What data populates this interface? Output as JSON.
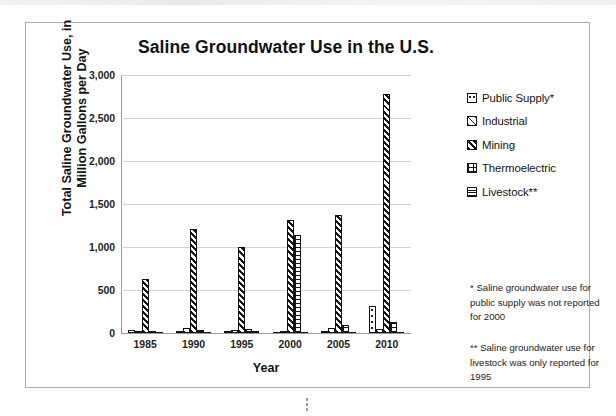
{
  "chart_data": {
    "type": "bar",
    "title": "Saline Groundwater Use in the U.S.",
    "xlabel": "Year",
    "ylabel": "Total Saline Groundwater Use, in Million Gallons per Day",
    "ylabel_line1": "Total Saline Groundwater Use, in",
    "ylabel_line2": "Million Gallons per Day",
    "categories": [
      "1985",
      "1990",
      "1995",
      "2000",
      "2005",
      "2010"
    ],
    "ylim": [
      0,
      3000
    ],
    "yticks": [
      0,
      500,
      1000,
      1500,
      2000,
      2500,
      3000
    ],
    "ytick_labels": [
      "0",
      "500",
      "1,000",
      "1,500",
      "2,000",
      "2,500",
      "3,000"
    ],
    "grid": true,
    "legend_position": "right",
    "series": [
      {
        "name": "Public Supply*",
        "key": "public",
        "pattern": "dotted",
        "values": [
          40,
          10,
          10,
          0,
          15,
          310
        ]
      },
      {
        "name": "Industrial",
        "key": "industrial",
        "pattern": "light-diagonal",
        "values": [
          15,
          55,
          40,
          10,
          55,
          45
        ]
      },
      {
        "name": "Mining",
        "key": "mining",
        "pattern": "dense-diagonal",
        "values": [
          630,
          1215,
          1005,
          1310,
          1375,
          2780
        ]
      },
      {
        "name": "Thermoelectric",
        "key": "thermo",
        "pattern": "grid",
        "values": [
          10,
          35,
          45,
          1140,
          95,
          130
        ]
      },
      {
        "name": "Livestock**",
        "key": "livestock",
        "pattern": "horizontal-lines",
        "values": [
          0,
          0,
          20,
          0,
          0,
          0
        ]
      }
    ]
  },
  "legend": {
    "items": [
      {
        "label": "Public Supply*"
      },
      {
        "label": "Industrial"
      },
      {
        "label": "Mining"
      },
      {
        "label": "Thermoelectric"
      },
      {
        "label": "Livestock**"
      }
    ]
  },
  "footnotes": {
    "one": "*  Saline groundwater use for public supply was not reported for 2000",
    "two": "**  Saline groundwater use for livestock was only reported for 1995"
  },
  "colors": {
    "ink": "#141414",
    "grid": "#d2d2d2",
    "axis": "#9a9a9a",
    "frame": "#adadad",
    "background": "#ffffff"
  }
}
